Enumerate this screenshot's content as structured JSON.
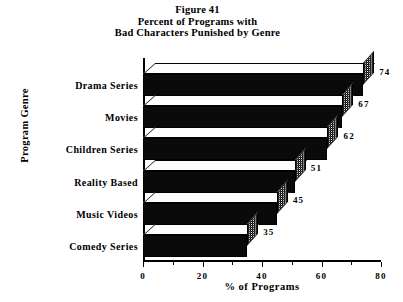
{
  "figure": {
    "title_line_1": "Figure 41",
    "title_line_2": "Percent of Programs with",
    "title_line_3": "Bad Characters Punished by Genre"
  },
  "axes": {
    "y_title": "Program Genre",
    "x_title": "% of Programs"
  },
  "chart_data": {
    "type": "bar",
    "orientation": "horizontal",
    "style": "3d-bar",
    "title": "Figure 41 Percent of Programs with Bad Characters Punished by Genre",
    "xlabel": "% of Programs",
    "ylabel": "Program Genre",
    "categories": [
      "Drama Series",
      "Movies",
      "Children Series",
      "Reality Based",
      "Music Videos",
      "Comedy Series"
    ],
    "values": [
      74,
      67,
      62,
      51,
      45,
      35
    ],
    "value_labels": [
      "74",
      "67",
      "62",
      "51",
      "45",
      "35"
    ],
    "xlim": [
      0,
      80
    ],
    "xticks": [
      0,
      20,
      40,
      60,
      80
    ],
    "xtick_labels": [
      "0",
      "20",
      "40",
      "60",
      "80"
    ],
    "x_minor_ticks": [
      10,
      30,
      50,
      70
    ],
    "grid": false,
    "legend": false,
    "colors": {
      "bar_front": "#0a0a0a",
      "bar_top": "#fdfdfd",
      "bar_side": "#808080",
      "axis": "#000000",
      "background": "#ffffff",
      "text": "#000000"
    }
  }
}
